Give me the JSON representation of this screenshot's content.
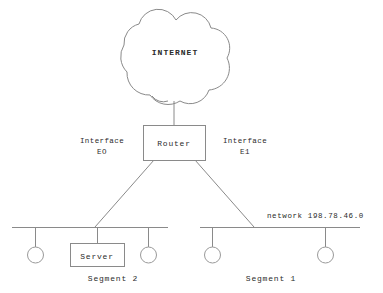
{
  "diagram": {
    "title_text": "INTERNET",
    "colors": {
      "line": "#8a8a8a",
      "text": "#2b2b2b",
      "background": "#ffffff"
    },
    "cloud": {
      "label": "INTERNET"
    },
    "router": {
      "label": "Router"
    },
    "interfaces": [
      {
        "name": "interface-e0",
        "line1": "Interface",
        "line2": "EO"
      },
      {
        "name": "interface-e1",
        "line1": "Interface",
        "line2": "E1"
      }
    ],
    "network_label": "network 198.78.46.0",
    "segments": [
      {
        "name": "segment-2",
        "label": "Segment 2",
        "nodes": [
          {
            "type": "host",
            "label": ""
          },
          {
            "type": "server",
            "label": "Server"
          },
          {
            "type": "host",
            "label": ""
          }
        ]
      },
      {
        "name": "segment-1",
        "label": "Segment 1",
        "nodes": [
          {
            "type": "host",
            "label": ""
          },
          {
            "type": "host",
            "label": ""
          }
        ]
      }
    ],
    "server": {
      "label": "Server"
    }
  }
}
